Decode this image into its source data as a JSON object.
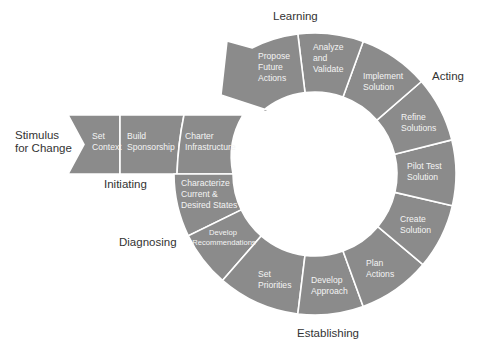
{
  "diagram": {
    "type": "cycle",
    "colors": {
      "segment_fill": "#8b8b8b",
      "segment_text": "#f4f4f4",
      "divider": "#ffffff",
      "phase_text": "#333333",
      "background": "#ffffff"
    },
    "phases": {
      "stimulus": [
        "Stimulus",
        "for Change"
      ],
      "initiating": "Initiating",
      "diagnosing": "Diagnosing",
      "establishing": "Establishing",
      "acting": "Acting",
      "learning": "Learning"
    },
    "entry_segments": [
      {
        "label": [
          "Set",
          "Context"
        ]
      },
      {
        "label": [
          "Build",
          "Sponsorship"
        ]
      },
      {
        "label": [
          "Charter",
          "Infrastructure"
        ]
      }
    ],
    "ring_segments": [
      {
        "label": [
          "Characterize",
          "Current &",
          "Desired States"
        ]
      },
      {
        "label": [
          "Develop",
          "Recommendations"
        ]
      },
      {
        "label": [
          "Set",
          "Priorities"
        ]
      },
      {
        "label": [
          "Develop",
          "Approach"
        ]
      },
      {
        "label": [
          "Plan",
          "Actions"
        ]
      },
      {
        "label": [
          "Create",
          "Solution"
        ]
      },
      {
        "label": [
          "Pilot Test",
          "Solution"
        ]
      },
      {
        "label": [
          "Refine",
          "Solutions"
        ]
      },
      {
        "label": [
          "Implement",
          "Solution"
        ]
      },
      {
        "label": [
          "Analyze",
          "and",
          "Validate"
        ]
      },
      {
        "label": [
          "Propose",
          "Future",
          "Actions"
        ]
      }
    ]
  }
}
